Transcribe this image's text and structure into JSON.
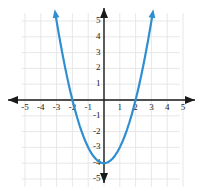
{
  "chart_data": {
    "type": "line",
    "title": "",
    "xlabel": "",
    "ylabel": "",
    "xlim": [
      -6.1,
      6.1
    ],
    "ylim": [
      -6.1,
      6.1
    ],
    "grid": true,
    "legend": null,
    "x_tick_labels": [
      "-5",
      "-4",
      "-3",
      "-2",
      "-1",
      "1",
      "2",
      "3",
      "4",
      "5"
    ],
    "x_tick_values": [
      -5,
      -4,
      -3,
      -2,
      -1,
      1,
      2,
      3,
      4,
      5
    ],
    "y_tick_labels": [
      "5",
      "4",
      "3",
      "2",
      "1",
      "-1",
      "-2",
      "-3",
      "-4",
      "-5"
    ],
    "y_tick_values": [
      5,
      4,
      3,
      2,
      1,
      -1,
      -2,
      -3,
      -4,
      -5
    ],
    "series": [
      {
        "name": "parabola",
        "equation": "y = x^2 - 4",
        "color": "#2f8fd0",
        "vertex": [
          0,
          -4
        ],
        "x_intercepts": [
          -2,
          2
        ],
        "y_intercept": -4,
        "arrow_ends": [
          "left-up",
          "right-up"
        ],
        "x": [
          -3.05,
          -2.9,
          -2.75,
          -2.6,
          -2.45,
          -2.3,
          -2.15,
          -2.0,
          -1.85,
          -1.7,
          -1.55,
          -1.4,
          -1.25,
          -1.1,
          -0.95,
          -0.8,
          -0.65,
          -0.5,
          -0.35,
          -0.2,
          -0.05,
          0.1,
          0.25,
          0.4,
          0.55,
          0.7,
          0.85,
          1.0,
          1.15,
          1.3,
          1.45,
          1.6,
          1.75,
          1.9,
          2.05,
          2.2,
          2.35,
          2.5,
          2.65,
          2.8,
          2.95,
          3.05
        ],
        "y": [
          5.3,
          4.41,
          3.56,
          2.76,
          2.0,
          1.29,
          0.62,
          0.0,
          -0.58,
          -1.11,
          -1.6,
          -2.04,
          -2.44,
          -2.79,
          -3.1,
          -3.36,
          -3.58,
          -3.75,
          -3.88,
          -3.96,
          -4.0,
          -3.99,
          -3.94,
          -3.84,
          -3.7,
          -3.51,
          -3.28,
          -3.0,
          -2.68,
          -2.31,
          -1.9,
          -1.44,
          -0.94,
          -0.39,
          0.2,
          0.84,
          1.52,
          2.25,
          3.02,
          3.84,
          4.7,
          5.3
        ]
      }
    ],
    "axis_color": "#1a1a1a",
    "grid_color": "#e4e4e4",
    "background": "#ffffff"
  }
}
